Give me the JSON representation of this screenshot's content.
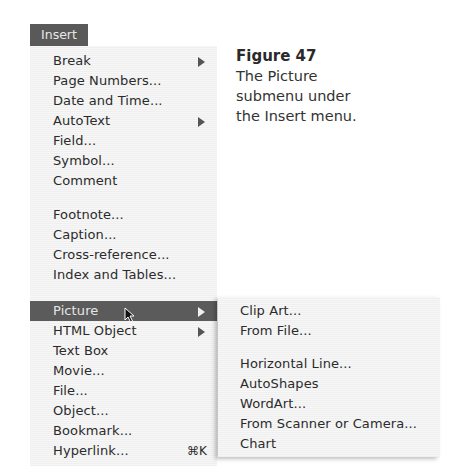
{
  "menu": {
    "title": "Insert",
    "items": [
      {
        "label": "Break",
        "submenu": true
      },
      {
        "label": "Page Numbers..."
      },
      {
        "label": "Date and Time..."
      },
      {
        "label": "AutoText",
        "submenu": true
      },
      {
        "label": "Field..."
      },
      {
        "label": "Symbol..."
      },
      {
        "label": "Comment"
      },
      {
        "label": "Footnote..."
      },
      {
        "label": "Caption..."
      },
      {
        "label": "Cross-reference..."
      },
      {
        "label": "Index and Tables..."
      },
      {
        "label": "Picture",
        "submenu": true,
        "highlighted": true
      },
      {
        "label": "HTML Object",
        "submenu": true
      },
      {
        "label": "Text Box"
      },
      {
        "label": "Movie..."
      },
      {
        "label": "File..."
      },
      {
        "label": "Object..."
      },
      {
        "label": "Bookmark..."
      },
      {
        "label": "Hyperlink...",
        "shortcut": "⌘K"
      }
    ]
  },
  "submenu": {
    "parent": "Picture",
    "items": [
      {
        "label": "Clip Art..."
      },
      {
        "label": "From File..."
      },
      {
        "label": "Horizontal Line..."
      },
      {
        "label": "AutoShapes"
      },
      {
        "label": "WordArt..."
      },
      {
        "label": "From Scanner or Camera..."
      },
      {
        "label": "Chart"
      }
    ]
  },
  "caption": {
    "figure": "Figure 47",
    "lines": [
      "The Picture",
      "submenu under",
      "the Insert menu."
    ]
  },
  "colors": {
    "highlight": "#5b5b5b",
    "menu_bg": "#f3f3f3",
    "text": "#2b2b2b"
  }
}
